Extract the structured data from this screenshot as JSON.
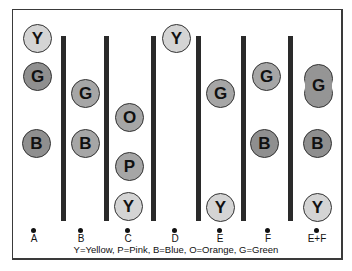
{
  "diagram": {
    "columns": [
      {
        "label": "A",
        "beads": [
          {
            "letter": "Y",
            "color": "Yellow",
            "y": 38
          },
          {
            "letter": "G",
            "color": "Green",
            "y": 76
          },
          {
            "letter": "B",
            "color": "Blue",
            "y": 143
          }
        ]
      },
      {
        "label": "B",
        "beads": [
          {
            "letter": "G",
            "color": "Green",
            "y": 93
          },
          {
            "letter": "B",
            "color": "Blue",
            "y": 143
          }
        ]
      },
      {
        "label": "C",
        "beads": [
          {
            "letter": "O",
            "color": "Orange",
            "y": 117
          },
          {
            "letter": "P",
            "color": "Pink",
            "y": 166
          },
          {
            "letter": "Y",
            "color": "Yellow",
            "y": 206
          }
        ]
      },
      {
        "label": "D",
        "beads": [
          {
            "letter": "Y",
            "color": "Yellow",
            "y": 38
          }
        ]
      },
      {
        "label": "E",
        "beads": [
          {
            "letter": "G",
            "color": "Green",
            "y": 93
          },
          {
            "letter": "Y",
            "color": "Yellow",
            "y": 207
          }
        ]
      },
      {
        "label": "F",
        "beads": [
          {
            "letter": "G",
            "color": "Green",
            "y": 76
          },
          {
            "letter": "B",
            "color": "Blue",
            "y": 143
          }
        ]
      },
      {
        "label": "E+F",
        "beads": [
          {
            "letter": "G",
            "color": "Green",
            "y": 86,
            "shape": "double"
          },
          {
            "letter": "B",
            "color": "Blue",
            "y": 143
          },
          {
            "letter": "Y",
            "color": "Yellow",
            "y": 207
          }
        ]
      }
    ],
    "legend": "Y=Yellow, P=Pink, B=Blue, O=Orange, G=Green"
  }
}
